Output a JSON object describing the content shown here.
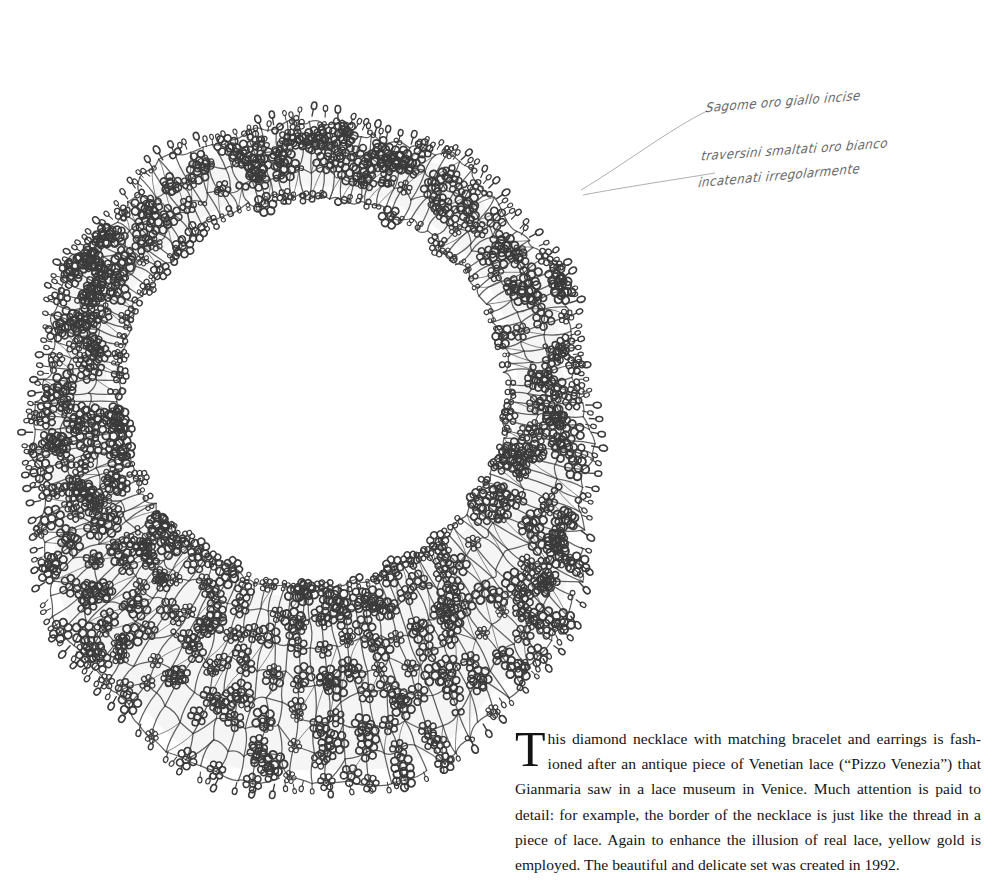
{
  "page": {
    "background_color": "#ffffff",
    "ink_color": "#2b2b2b"
  },
  "figure": {
    "name": "diamond-necklace-lace-drawing",
    "center_x": 312,
    "center_y": 392,
    "inner_radius": 196,
    "outer_radius_top": 300,
    "outer_radius_bottom": 400
  },
  "annotation": {
    "line1": "Sagome oro giallo incise",
    "line2": "traversini smaltati oro bianco",
    "line3": "incatenati irregolarmente",
    "ink_color": "#3a3a3a",
    "leader_lines": 2
  },
  "caption": {
    "dropcap": "T",
    "text": "his diamond necklace with matching bracelet and earrings is fash-ioned after an antique piece of Venetian lace (“Pizzo Venezia”) that Gianmaria saw in a lace museum in Venice. Much attention is paid to detail: for example, the border of the necklace is just like the thread in a piece of lace. Again to enhance the illusion of real lace, yellow gold is employed. The beautiful and delicate set was created in 1992.",
    "year": "1992",
    "piece_name": "Pizzo Venezia",
    "designer": "Gianmaria",
    "city": "Venice",
    "metal": "yellow gold"
  }
}
